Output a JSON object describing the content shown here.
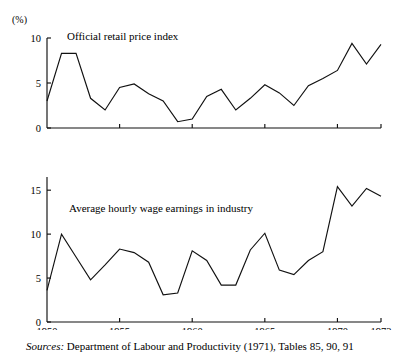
{
  "figure": {
    "unit_label": "(%)",
    "source_prefix": "Sources:",
    "source_text": "Department of Labour and Productivity (1971), Tables 85, 90, 91",
    "line_color": "#111111",
    "background_color": "#ffffff"
  },
  "chart_data": [
    {
      "type": "line",
      "title": "Official retail price index",
      "xlabel": "",
      "ylabel": "(%)",
      "ylim": [
        0,
        10
      ],
      "xlim": [
        1950,
        1973
      ],
      "yticks": [
        0,
        5,
        10
      ],
      "ytick_labels": [
        "0",
        "5",
        "10"
      ],
      "xticks": [
        1950,
        1955,
        1960,
        1965,
        1970,
        1973
      ],
      "xtick_labels": [
        "1950",
        "1955",
        "1960",
        "1965",
        "1970",
        "1973"
      ],
      "show_xtick_labels": false,
      "grid": false,
      "legend": "none",
      "x": [
        1950,
        1951,
        1952,
        1953,
        1954,
        1955,
        1956,
        1957,
        1958,
        1959,
        1960,
        1961,
        1962,
        1963,
        1964,
        1965,
        1966,
        1967,
        1968,
        1969,
        1970,
        1971,
        1972,
        1973
      ],
      "values": [
        3.0,
        8.3,
        8.3,
        3.3,
        2.0,
        4.5,
        4.9,
        3.8,
        3.0,
        0.7,
        1.0,
        3.5,
        4.3,
        2.0,
        3.3,
        4.8,
        3.9,
        2.5,
        4.7,
        5.5,
        6.4,
        9.4,
        7.1,
        9.3
      ]
    },
    {
      "type": "line",
      "title": "Average hourly wage earnings in industry",
      "xlabel": "",
      "ylabel": "(%)",
      "ylim": [
        0,
        16.5
      ],
      "xlim": [
        1950,
        1973
      ],
      "yticks": [
        0,
        5,
        10,
        15
      ],
      "ytick_labels": [
        "0",
        "5",
        "10",
        "15"
      ],
      "xticks": [
        1950,
        1955,
        1960,
        1965,
        1970,
        1973
      ],
      "xtick_labels": [
        "1950",
        "1955",
        "1960",
        "1965",
        "1970",
        "1973"
      ],
      "show_xtick_labels": true,
      "grid": false,
      "legend": "none",
      "x": [
        1950,
        1951,
        1952,
        1953,
        1954,
        1955,
        1956,
        1957,
        1958,
        1959,
        1960,
        1961,
        1962,
        1963,
        1964,
        1965,
        1966,
        1967,
        1968,
        1969,
        1970,
        1971,
        1972,
        1973
      ],
      "values": [
        3.6,
        10.0,
        7.4,
        4.8,
        6.5,
        8.3,
        7.9,
        6.8,
        3.1,
        3.3,
        8.1,
        7.0,
        4.2,
        4.2,
        8.2,
        10.1,
        5.9,
        5.4,
        7.0,
        8.0,
        15.4,
        13.2,
        15.2,
        14.3
      ]
    }
  ]
}
